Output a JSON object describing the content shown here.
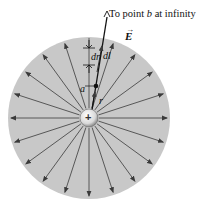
{
  "diagram": {
    "title_prefix": "To point ",
    "title_var": "b",
    "title_suffix": " at infinity",
    "field_label": "E",
    "point_label": "a",
    "radius_label": "r",
    "dr_label": "dr",
    "dl_label": "dl",
    "charge_sign": "+",
    "colors": {
      "disk": "#c8c8c8",
      "lines": "#3a3a3a",
      "charge_fill": "#f0f0f0",
      "background": "#ffffff"
    },
    "field_line_count": 20
  }
}
